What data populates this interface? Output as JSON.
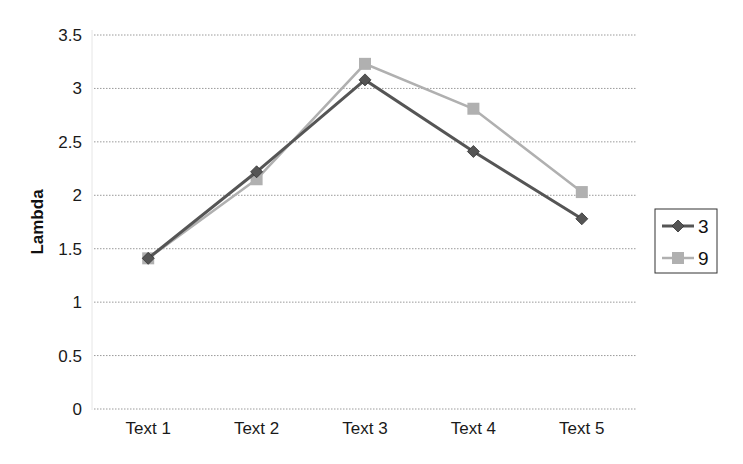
{
  "chart_data": {
    "type": "line",
    "title": "",
    "xlabel": "",
    "ylabel": "Lambda",
    "categories": [
      "Text 1",
      "Text 2",
      "Text 3",
      "Text 4",
      "Text 5"
    ],
    "series": [
      {
        "name": "3",
        "values": [
          1.41,
          2.22,
          3.08,
          2.41,
          1.78
        ],
        "color": "#555555",
        "marker": "diamond"
      },
      {
        "name": "9",
        "values": [
          1.41,
          2.15,
          3.23,
          2.81,
          2.03
        ],
        "color": "#b0b0b0",
        "marker": "square"
      }
    ],
    "ylim": [
      0,
      3.5
    ],
    "yticks": [
      "0",
      "0.5",
      "1",
      "1.5",
      "2",
      "2.5",
      "3",
      "3.5"
    ],
    "ytick_values": [
      0,
      0.5,
      1,
      1.5,
      2,
      2.5,
      3,
      3.5
    ],
    "grid": true,
    "legend_position": "right"
  }
}
